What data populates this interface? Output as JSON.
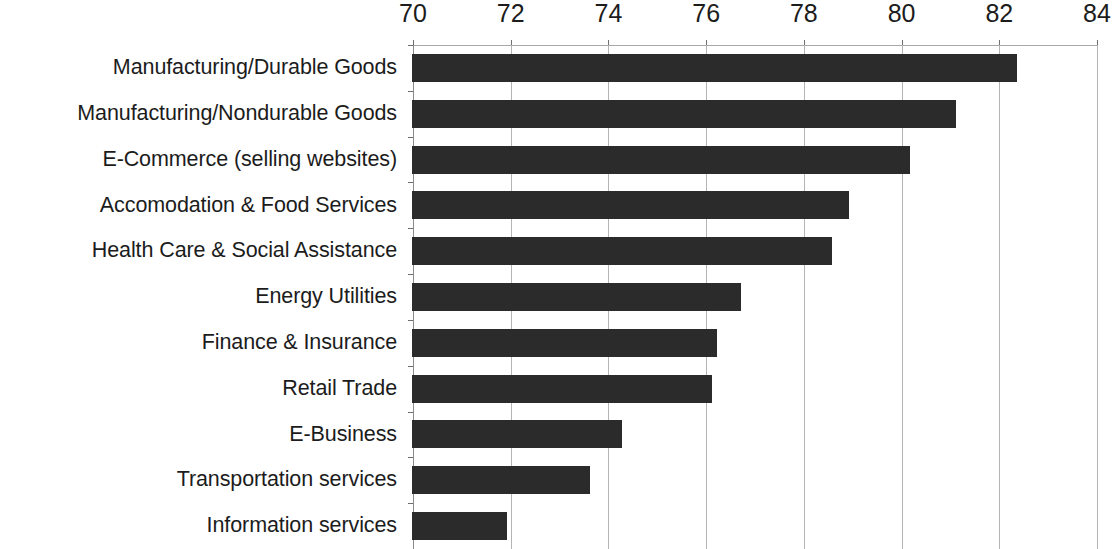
{
  "chart_data": {
    "type": "bar",
    "orientation": "horizontal",
    "title": "",
    "clipped_title_fragment": "",
    "xlabel": "",
    "ylabel": "",
    "xlim": [
      70,
      84
    ],
    "grid": true,
    "legend": "none",
    "x_ticks": [
      70,
      72,
      74,
      76,
      78,
      80,
      82,
      84
    ],
    "x_tick_labels": [
      "70",
      "72",
      "74",
      "76",
      "78",
      "80",
      "82",
      "84"
    ],
    "categories": [
      "Manufacturing/Durable Goods",
      "Manufacturing/Nondurable Goods",
      "E-Commerce (selling websites)",
      "Accomodation & Food Services",
      "Health Care & Social Assistance",
      "Energy Utilities",
      "Finance & Insurance",
      "Retail Trade",
      "E-Business",
      "Transportation services",
      "Information services"
    ],
    "values": [
      82.35,
      81.1,
      80.15,
      78.9,
      78.55,
      76.7,
      76.2,
      76.1,
      74.25,
      73.6,
      71.9
    ],
    "bar_color": "#2b2b2b",
    "grid_color": "#b4b4b4",
    "axis_color": "#8a8a8a",
    "background_color": "#ffffff"
  }
}
